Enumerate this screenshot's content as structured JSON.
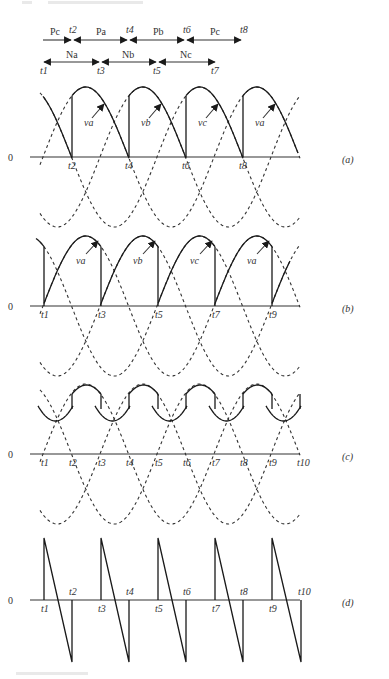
{
  "figure": {
    "header_text_visible": false,
    "interval_bars": {
      "positive_groups": [
        "Pc",
        "Pa",
        "Pb",
        "Pc"
      ],
      "positive_times": [
        "t2",
        "t4",
        "t6",
        "t8"
      ],
      "negative_groups": [
        "Na",
        "Nb",
        "Nc"
      ],
      "negative_times": [
        "t1",
        "t3",
        "t5",
        "t7"
      ]
    },
    "panels": [
      {
        "id": "a",
        "label": "(a)",
        "zero_label": "0",
        "time_labels": [
          "t2",
          "t4",
          "t6",
          "t8"
        ],
        "wave_labels": [
          "va",
          "vb",
          "vc",
          "va"
        ]
      },
      {
        "id": "b",
        "label": "(b)",
        "zero_label": "0",
        "time_labels": [
          "t1",
          "t3",
          "t5",
          "t7",
          "t9"
        ],
        "wave_labels": [
          "va",
          "vb",
          "vc",
          "va"
        ]
      },
      {
        "id": "c",
        "label": "(c)",
        "zero_label": "0",
        "time_labels": [
          "t1",
          "t2",
          "t3",
          "t4",
          "t5",
          "t6",
          "t7",
          "t8",
          "t9",
          "t10"
        ]
      },
      {
        "id": "d",
        "label": "(d)",
        "zero_label": "0",
        "time_labels_below": [
          "t1",
          "t3",
          "t5",
          "t7",
          "t9"
        ],
        "time_labels_above": [
          "t2",
          "t4",
          "t6",
          "t8",
          "t10"
        ]
      }
    ]
  },
  "chart_data": {
    "type": "line",
    "title": "",
    "xlabel": "time",
    "ylabel": "voltage",
    "series": [
      {
        "name": "va",
        "style": "dashed"
      },
      {
        "name": "vb",
        "style": "dashed"
      },
      {
        "name": "vc",
        "style": "dashed"
      },
      {
        "name": "output (a) positive group",
        "style": "solid"
      },
      {
        "name": "output (b) negative group",
        "style": "solid"
      },
      {
        "name": "output (c) load voltage",
        "style": "solid"
      },
      {
        "name": "output (d) difference voltage",
        "style": "solid"
      }
    ],
    "phase_shift_deg": 120,
    "grid": false
  }
}
